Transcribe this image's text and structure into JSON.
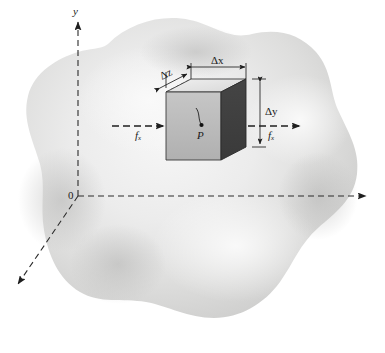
{
  "figure": {
    "background_color": "#ffffff",
    "width": 385,
    "height": 353
  },
  "axes": {
    "y_axis_label": "y",
    "x_axis_label": "",
    "z_axis_label": "",
    "origin_label": "0",
    "style": "dashed",
    "color": "#2b2b2b",
    "directions": {
      "y": "up",
      "x": "right",
      "z": "down-left"
    }
  },
  "body": {
    "name": "continuum-blob",
    "fill_light": "#f2f2f2",
    "fill_mid": "#dcdcdc",
    "fill_dark": "#c8c8c8",
    "shape": "irregular-rounded-blob"
  },
  "element": {
    "name": "differential-cube",
    "point_label": "P",
    "face_colors": {
      "front_left": "#b9b9b9",
      "right": "#4a4a4a",
      "top": "#e8e8e8",
      "top_front": "#d2d2d2"
    },
    "edge_color": "#3a3a3a"
  },
  "dimensions": [
    {
      "id": "dz",
      "label": "Δz",
      "orientation": "diagonal"
    },
    {
      "id": "dx",
      "label": "Δx",
      "orientation": "horizontal"
    },
    {
      "id": "dy",
      "label": "Δy",
      "orientation": "vertical"
    }
  ],
  "forces": [
    {
      "id": "f-left",
      "label": "f",
      "subscript": "x",
      "direction": "right",
      "position": "left-of-element"
    },
    {
      "id": "f-right",
      "label": "f",
      "subscript": "x",
      "direction": "right",
      "position": "right-of-element"
    }
  ]
}
